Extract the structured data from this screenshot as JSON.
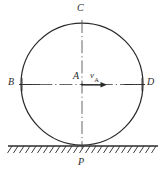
{
  "figure": {
    "colors": {
      "stroke": "#2b2b2b",
      "centerline": "#555555",
      "background": "#ffffff",
      "label": "#2b2b2b"
    },
    "geometry": {
      "circle_center_x": 82,
      "circle_center_y": 84,
      "circle_radius": 61,
      "ground_y": 146,
      "ground_x_start": 8,
      "ground_x_end": 158,
      "hatch_count": 24,
      "arrow_start_x": 82,
      "arrow_end_x": 106,
      "arrow_y": 85
    },
    "labels": {
      "top": "C",
      "left": "B",
      "center": "A",
      "right": "D",
      "bottom": "P",
      "velocity_symbol": "v",
      "velocity_subscript": "A"
    }
  }
}
